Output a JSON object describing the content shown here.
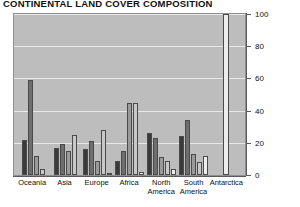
{
  "chart_data": {
    "type": "bar",
    "title": "CONTINENTAL LAND COVER COMPOSITION",
    "xlabel": "",
    "ylabel": "Land cover composition (per cent)",
    "ylim": [
      0,
      100
    ],
    "yticks": [
      0,
      20,
      40,
      60,
      80,
      100
    ],
    "grid": true,
    "legend": "none",
    "categories": [
      "Oceania",
      "Asia",
      "Europe",
      "Africa",
      "North America",
      "South America",
      "Antarctica"
    ],
    "series": [
      {
        "name": "Class 1",
        "color": "#3a3a3a",
        "values": [
          22,
          17,
          16,
          9,
          26,
          24,
          0
        ]
      },
      {
        "name": "Class 2",
        "color": "#6e6e6e",
        "values": [
          59,
          19,
          21,
          15,
          23,
          34,
          0
        ]
      },
      {
        "name": "Class 3",
        "color": "#9a9a9a",
        "values": [
          12,
          15,
          9,
          45,
          11,
          13,
          0
        ]
      },
      {
        "name": "Class 4",
        "color": "#c8c8c8",
        "values": [
          4,
          25,
          28,
          45,
          9,
          8,
          0
        ]
      },
      {
        "name": "Class 5",
        "color": "#ededed",
        "values": [
          0,
          0,
          1,
          2,
          4,
          12,
          100
        ]
      }
    ],
    "colors": {
      "plot_background": "#bdbdbd",
      "gridline": "#e9e9e9",
      "axis": "#5a5a5a",
      "bar_outline": "#4a4a4a"
    }
  }
}
